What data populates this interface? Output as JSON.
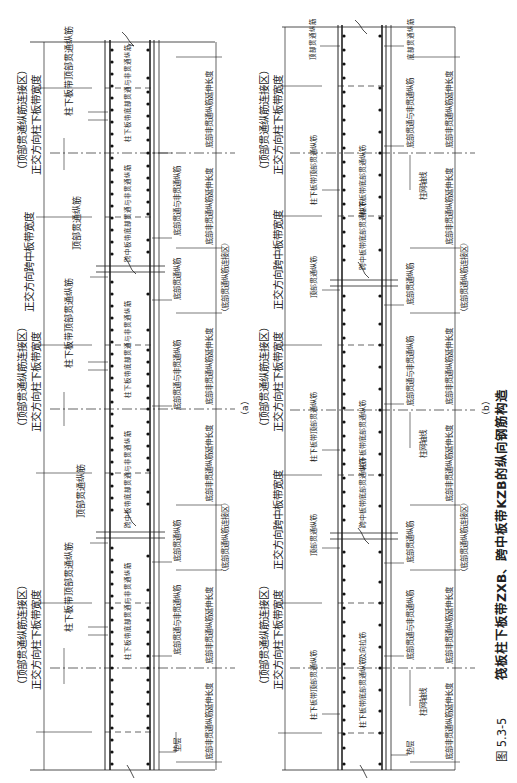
{
  "figure": {
    "number": "图 5.3-5",
    "title": "筏板柱下板带ZXB、跨中板带KZB的纵向钢筋构造"
  },
  "panels": [
    {
      "id": "a",
      "caption": "（a）",
      "band_labels": {
        "column_band_width": "正交方向柱下板带宽度",
        "top_splice_zone": "（顶部贯通纵筋连接区）",
        "span_band_width": "正交方向跨中板带宽度",
        "bottom_splice_zone": "（底部贯通纵筋连接区）"
      },
      "rebar_labels": {
        "column_band_top_through": "柱下板带顶部贯通纵筋",
        "span_band_top_through": "顶部贯通纵筋",
        "column_band_bottom_through_nonthrough": "柱下板带底部贯通与非贯通纵筋",
        "span_band_bottom_through_nonthrough": "跨中板带底部贯通与非贯通纵筋",
        "bottom_through_and_nonthrough": "底部贯通与非贯通纵筋",
        "bottom_through": "底部贯通纵筋",
        "cushion": "垫层"
      },
      "dimension_labels": {
        "bottom_nonthrough_extension": "底部非贯通纵筋延伸长度"
      }
    },
    {
      "id": "b",
      "caption": "（b）",
      "band_labels": {
        "column_band_width": "正交方向柱下板带宽度",
        "top_splice_zone": "（顶部贯通纵筋连接区）",
        "span_band_width": "正交方向跨中板带宽度",
        "bottom_splice_zone": "（底部贯通纵筋连接区）"
      },
      "rebar_labels": {
        "column_band_top_through": "柱下板带顶部贯通纵筋",
        "top_through": "顶部贯通纵筋",
        "column_band_bottom_through": "柱下板带底部贯通纵筋",
        "span_band_bottom_through": "跨中板带底部贯通纵筋",
        "bottom_through_and_nonthrough": "底部贯通与非贯通纵筋",
        "bottom_through": "底部贯通纵筋",
        "column_grid_axis": "柱网轴线",
        "transverse_tie": "及向拉筋",
        "cushion": "垫层"
      },
      "dimension_labels": {
        "bottom_nonthrough_extension": "底部非贯通纵筋延伸长度"
      }
    }
  ]
}
